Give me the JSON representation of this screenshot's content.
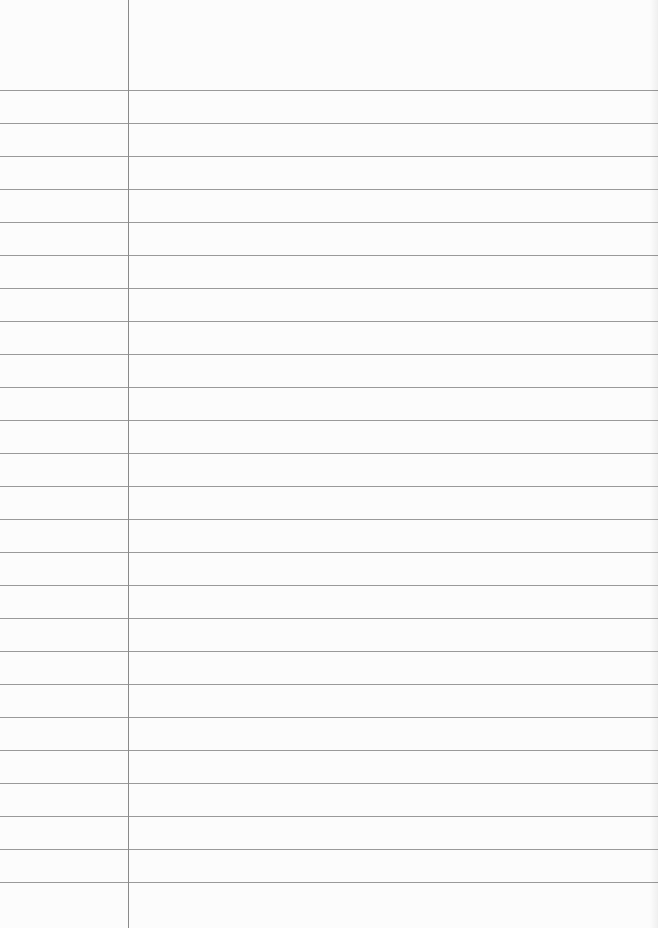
{
  "page": {
    "type": "lined-paper",
    "background": "#fcfcfc",
    "rule_color": "#9a9a9a",
    "margin_color": "#8a8a8a",
    "margin_x": 128,
    "first_rule_y": 90,
    "rule_spacing": 33,
    "rule_count": 25,
    "text": []
  }
}
